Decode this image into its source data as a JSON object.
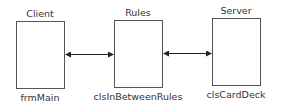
{
  "diagram": {
    "nodes": [
      {
        "id": "client",
        "title": "Client",
        "caption": "frmMain"
      },
      {
        "id": "rules",
        "title": "Rules",
        "caption": "clsInBetweenRules"
      },
      {
        "id": "server",
        "title": "Server",
        "caption": "clsCardDeck"
      }
    ],
    "edges": [
      {
        "from": "client",
        "to": "rules",
        "type": "bidirectional"
      },
      {
        "from": "rules",
        "to": "server",
        "type": "bidirectional"
      }
    ],
    "colors": {
      "stroke": "#555555",
      "arrow": "#222222",
      "text": "#333333"
    }
  }
}
